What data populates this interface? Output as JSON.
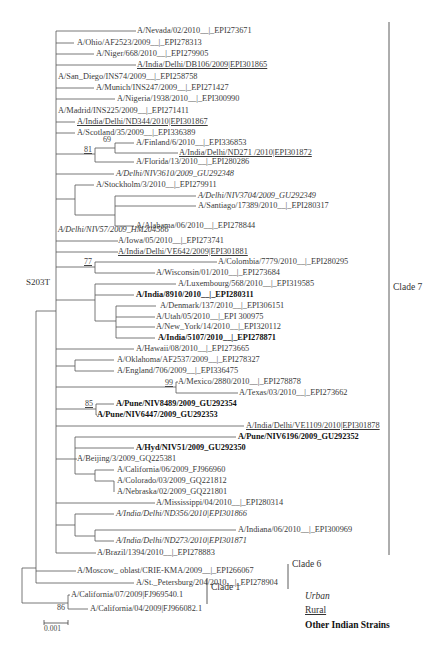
{
  "figure": {
    "mutation_label": "S203T",
    "scale_bar": {
      "label": "0.001"
    },
    "clades": [
      {
        "label": "Clade 7"
      },
      {
        "label": "Clade 6"
      },
      {
        "label": "Clade 1"
      }
    ],
    "legend": [
      {
        "label": "Urban",
        "style": "italic"
      },
      {
        "label": "Rural",
        "style": "underline"
      },
      {
        "label": "Other Indian Strains",
        "style": "bold"
      }
    ],
    "bootstrap": [
      "69",
      "81",
      "77",
      "99",
      "85",
      "86"
    ],
    "caption_fragment": "Figure ..."
  },
  "leaves": [
    {
      "label": "A/Nevada/02/2010__|_EPI273671",
      "style": "plain"
    },
    {
      "label": "A/Ohio/AF2523/2009__|_EPI278313",
      "style": "plain"
    },
    {
      "label": "A/Niger/668/2010__|_EPI279905",
      "style": "plain"
    },
    {
      "label": "A/India/Delhi/DB106/2009|EPI301865",
      "style": "rural"
    },
    {
      "label": "A/San_Diego/INS74/2009__|_EPI258758",
      "style": "plain"
    },
    {
      "label": "A/Munich/INS247/2009__|_EPI271427",
      "style": "plain"
    },
    {
      "label": "A/Nigeria/1938/2010__|_EPI300990",
      "style": "plain"
    },
    {
      "label": "A/Madrid/INS225/2009__|_EPI271411",
      "style": "plain"
    },
    {
      "label": "A/India/Delhi/ND344/2010|EPI301867",
      "style": "rural"
    },
    {
      "label": "A/Scotland/35/2009__|_EPI336389",
      "style": "plain"
    },
    {
      "label": "A/Finland/6/2010__|_EPI336853",
      "style": "plain"
    },
    {
      "label": "A/India/Delhi/ND271 /2010|EPI301872",
      "style": "rural"
    },
    {
      "label": "A/Florida/13/2010__|_EPI280286",
      "style": "plain"
    },
    {
      "label": "A/Delhi/NIV3610/2009_GU292348",
      "style": "urban"
    },
    {
      "label": "A/Stockholm/3/2010__|_EPI279911",
      "style": "plain"
    },
    {
      "label": "A/Delhi/NIV3704/2009_GU292349",
      "style": "urban"
    },
    {
      "label": "A/Santiago/17389/2010__|_EPI280317",
      "style": "plain"
    },
    {
      "label": "A/Alabama/06/2010__|_EPI278844",
      "style": "plain"
    },
    {
      "label": "A/Delhi/NIV57/2009_HM204566",
      "style": "urban"
    },
    {
      "label": "A/Iowa/05/2010__|_EPI273741",
      "style": "plain"
    },
    {
      "label": "A/India/Delhi/VE642/2009|EPI301881",
      "style": "rural"
    },
    {
      "label": "A/Colombia/7779/2010__|_EPI280295",
      "style": "plain"
    },
    {
      "label": "A/Wisconsin/01/2010__|_EPI273684",
      "style": "plain"
    },
    {
      "label": "A/Luxembourg/568/2010__|_EPI319585",
      "style": "plain"
    },
    {
      "label": "A/India/8910/2010__|_EPI280311",
      "style": "other"
    },
    {
      "label": "A/Denmark/137/2010__|_EPI306151",
      "style": "plain"
    },
    {
      "label": "A/Utah/05/2010__|_EPI 300975",
      "style": "plain"
    },
    {
      "label": "A/New_York/14/2010__|_EPI320112",
      "style": "plain"
    },
    {
      "label": "A/India/5107/2010__|_EPI278871",
      "style": "other"
    },
    {
      "label": "A/Hawaii/08/2010__|_EPI273665",
      "style": "plain"
    },
    {
      "label": "A/Oklahoma/AF2537/2009__|_EPI278327",
      "style": "plain"
    },
    {
      "label": "A/England/706/2009__|_EPI336475",
      "style": "plain"
    },
    {
      "label": "A/Mexico/2880/2010__|_EPI278878",
      "style": "plain"
    },
    {
      "label": "A/Texas/03/2010__|_EPI273662",
      "style": "plain"
    },
    {
      "label": "A/Pune/NIV8489/2009_GU292354",
      "style": "other"
    },
    {
      "label": "A/Pune/NIV6447/2009_GU292353",
      "style": "other"
    },
    {
      "label": "A/India/Delhi/VE1109/2010|EPI301878",
      "style": "rural"
    },
    {
      "label": "A/Pune/NIV6196/2009_GU292352",
      "style": "other"
    },
    {
      "label": "A/Hyd/NIV51/2009_GU292350",
      "style": "other"
    },
    {
      "label": "A/Beijing/3/2009_GQ225381",
      "style": "plain"
    },
    {
      "label": "A/California/06/2009_FJ966960",
      "style": "plain"
    },
    {
      "label": "A/Colorado/03/2009_GQ221812",
      "style": "plain"
    },
    {
      "label": "A/Nebraska/02/2009_GQ221801",
      "style": "plain"
    },
    {
      "label": "A/Mississippi/04/2010__|_EPI280314",
      "style": "plain"
    },
    {
      "label": "A/India/Delhi/ND356/2010|EPI301866",
      "style": "urban"
    },
    {
      "label": "A/Indiana/06/2010__|_EPI300969",
      "style": "plain"
    },
    {
      "label": "A/India/Delhi/ND273/2010|EPI301871",
      "style": "urban"
    },
    {
      "label": "A/Brazil/1394/2010__|_EPI278883",
      "style": "plain"
    },
    {
      "label": "A/Moscow_ oblast/CRIE-KMA/2009__|_EPI266067",
      "style": "plain"
    },
    {
      "label": "A/St._Petersburg/204/2010__|_EPI278904",
      "style": "plain"
    },
    {
      "label": "A/California/07/2009|FJ969540.1",
      "style": "plain"
    },
    {
      "label": "A/California/04/2009|FJ966082.1",
      "style": "plain"
    }
  ]
}
